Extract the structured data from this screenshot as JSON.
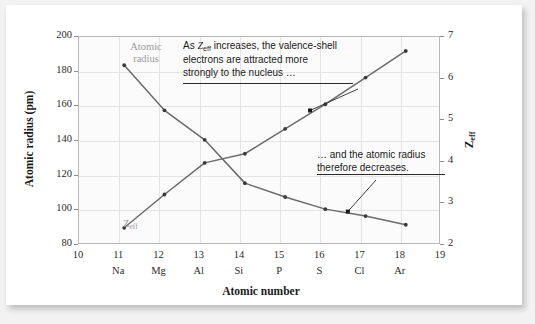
{
  "chart_data": {
    "type": "line",
    "title": "",
    "xlabel": "Atomic number",
    "ylabel": "Atomic radius (pm)",
    "y2label": "Zeff",
    "xlim": [
      10,
      19
    ],
    "ylim": [
      80,
      200
    ],
    "y2lim": [
      2,
      7
    ],
    "grid": true,
    "legend_position": "inline-labels",
    "x": [
      11,
      12,
      13,
      14,
      15,
      16,
      17,
      18
    ],
    "categories": [
      "Na",
      "Mg",
      "Al",
      "Si",
      "P",
      "S",
      "Cl",
      "Ar"
    ],
    "x_tick_labels": [
      "10",
      "11",
      "12",
      "13",
      "14",
      "15",
      "16",
      "17",
      "18",
      "19"
    ],
    "x_tick_values": [
      10,
      11,
      12,
      13,
      14,
      15,
      16,
      17,
      18,
      19
    ],
    "element_labels": [
      "",
      "Na",
      "Mg",
      "Al",
      "Si",
      "P",
      "S",
      "Cl",
      "Ar",
      ""
    ],
    "y_tick_labels": [
      "80",
      "100",
      "120",
      "140",
      "160",
      "180",
      "200"
    ],
    "y_tick_values": [
      80,
      100,
      120,
      140,
      160,
      180,
      200
    ],
    "y2_tick_labels": [
      "2",
      "3",
      "4",
      "5",
      "6",
      "7"
    ],
    "y2_tick_values": [
      2,
      3,
      4,
      5,
      6,
      7
    ],
    "series": [
      {
        "name": "Atomic radius",
        "axis": "left",
        "unit": "pm",
        "color": "#6b6b6b",
        "values": [
          186,
          160,
          143,
          118,
          110,
          103,
          99,
          94
        ]
      },
      {
        "name": "Zeff",
        "axis": "right",
        "unit": "",
        "color": "#6b6b6b",
        "values": [
          2.51,
          3.31,
          4.07,
          4.29,
          4.89,
          5.48,
          6.12,
          6.76
        ]
      }
    ],
    "annotations": [
      {
        "id": "annotation-1",
        "text": "As Zeff increases, the valence-shell\nelectrons are attracted more\nstrongly to the nucleus …",
        "line1_prefix": "As ",
        "line1_symbol": "Z",
        "line1_subscript": "eff",
        "line1_rest": " increases, the valence-shell",
        "line2": "electrons are attracted more",
        "line3": "strongly to the nucleus …",
        "points_to_series": "Zeff"
      },
      {
        "id": "annotation-2",
        "text": "… and the atomic radius\ntherefore decreases.",
        "line1": "… and the atomic radius",
        "line2": "therefore decreases.",
        "points_to_series": "Atomic radius"
      }
    ],
    "series_labels": [
      {
        "id": "label-atomic-radius",
        "line1": "Atomic",
        "line2": "radius",
        "color": "#9a9a9a"
      },
      {
        "id": "label-zeff",
        "symbol": "Z",
        "subscript": "eff",
        "color": "#9a9a9a"
      }
    ]
  },
  "axes": {
    "y_left_title_main": "Atomic radius (pm)",
    "y_right_title_symbol": "Z",
    "y_right_title_sub": "eff",
    "x_title": "Atomic number"
  },
  "colors": {
    "line": "#6b6b6b",
    "marker": "#3a3a3a",
    "grid": "#e4e4e4",
    "frame": "#b9b9b9",
    "plot_bg": "#fbfbfb",
    "card_bg": "#ffffff",
    "page_bg": "#f2f2f2",
    "text": "#1a1a1a",
    "muted_text": "#9a9a9a"
  }
}
